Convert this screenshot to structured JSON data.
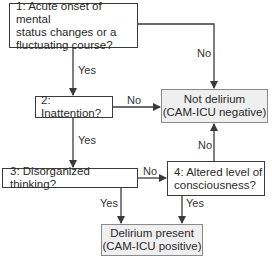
{
  "diagram": {
    "type": "flowchart",
    "colors": {
      "line": "#3a3a3a",
      "outcome_fill": "#efefef",
      "outcome_border": "#8a8a8a"
    },
    "nodes": {
      "q1": {
        "text": "1: Acute onset of mental\nstatus changes or a\nfluctuating course?"
      },
      "q2": {
        "text": "2: Inattention?"
      },
      "q3": {
        "text": "3: Disorganized thinking?"
      },
      "q4": {
        "text": "4: Altered level of\nconsciousness?"
      },
      "neg": {
        "text": "Not delirium\n(CAM-ICU negative)"
      },
      "pos": {
        "text": "Delirium present\n(CAM-ICU positive)"
      }
    },
    "edges": {
      "q1_yes": "Yes",
      "q1_no": "No",
      "q2_yes": "Yes",
      "q2_no": "No",
      "q3_yes": "Yes",
      "q3_no": "No",
      "q4_yes": "Yes",
      "q4_no": "No"
    }
  }
}
